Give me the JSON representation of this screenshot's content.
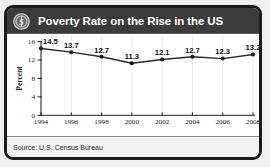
{
  "header": {
    "title": "Poverty Rate on the Rise in the US",
    "icon": "dollar-circle-icon"
  },
  "footer": {
    "source": "Source: U.S. Census Bureau"
  },
  "colors": {
    "border": "#1b1b1b",
    "header_background": "#3b3b3b",
    "header_text": "#ffffff",
    "plot_background": "#ffffff",
    "line": "#2a2a2a",
    "marker": "#1b1b1b",
    "grid": "#dfe4ea",
    "source_background": "#f2f2f2",
    "page_background": "#efefef"
  },
  "chart_data": {
    "type": "line",
    "title": "Poverty Rate on the Rise in the US",
    "subtitle": "",
    "xlabel": "",
    "ylabel": "Percent",
    "categories": [
      "1994",
      "1996",
      "1998",
      "2000",
      "2002",
      "2004",
      "2006",
      "2008"
    ],
    "values": [
      14.5,
      13.7,
      12.7,
      11.3,
      12.1,
      12.7,
      12.3,
      13.2
    ],
    "data_labels": [
      "14.5",
      "13.7",
      "12.7",
      "11.3",
      "12.1",
      "12.7",
      "12.3",
      "13.2"
    ],
    "ylim": [
      0,
      16
    ],
    "yticks": [
      0,
      4,
      8,
      12,
      16
    ],
    "ytick_labels": [
      "0",
      "4",
      "8",
      "12",
      "16"
    ],
    "grid": "vertical",
    "legend": "none",
    "markers": true,
    "source": "Source: U.S. Census Bureau"
  }
}
